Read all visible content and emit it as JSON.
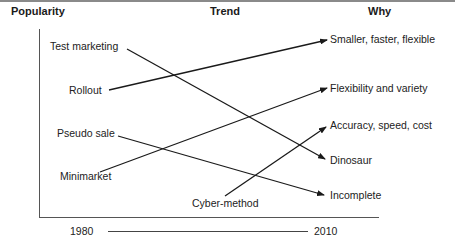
{
  "headers": {
    "popularity": "Popularity",
    "trend": "Trend",
    "why": "Why"
  },
  "left_items": [
    {
      "label": "Test marketing"
    },
    {
      "label": "Rollout"
    },
    {
      "label": "Pseudo sale"
    },
    {
      "label": "Minimarket"
    },
    {
      "label": "Cyber-method"
    }
  ],
  "right_items": [
    {
      "label": "Smaller, faster, flexible"
    },
    {
      "label": "Flexibility and variety"
    },
    {
      "label": "Accuracy, speed, cost"
    },
    {
      "label": "Dinosaur"
    },
    {
      "label": "Incomplete"
    }
  ],
  "connections": [
    {
      "from": "Test marketing",
      "to": "Dinosaur"
    },
    {
      "from": "Rollout",
      "to": "Smaller, faster, flexible"
    },
    {
      "from": "Pseudo sale",
      "to": "Incomplete"
    },
    {
      "from": "Minimarket",
      "to": "Flexibility and variety"
    },
    {
      "from": "Cyber-method",
      "to": "Accuracy, speed, cost"
    }
  ],
  "timeline": {
    "start": "1980",
    "end": "2010"
  },
  "colors": {
    "line": "#1a1a1a",
    "axis": "#555555",
    "top_border": "#8a8a8a"
  }
}
